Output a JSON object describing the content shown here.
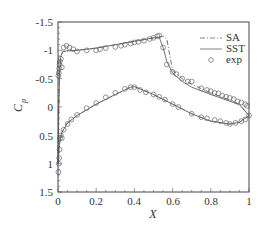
{
  "chart_data": {
    "type": "line",
    "title": "",
    "xlabel": "X",
    "ylabel": "C_p",
    "xlim": [
      0,
      1
    ],
    "ylim": [
      1.5,
      -1.5
    ],
    "y_inverted": true,
    "grid": false,
    "legend_position": "upper right",
    "x_ticks": [
      "0",
      "0.2",
      "0.4",
      "0.6",
      "0.8",
      "1"
    ],
    "y_ticks": [
      "-1.5",
      "-1",
      "-0.5",
      "0",
      "0.5",
      "1",
      "1.5"
    ],
    "series": [
      {
        "name": "SA",
        "style": "dash-dot",
        "upper": {
          "x": [
            0.0,
            0.003,
            0.008,
            0.015,
            0.025,
            0.05,
            0.1,
            0.2,
            0.3,
            0.4,
            0.5,
            0.55,
            0.57,
            0.58,
            0.6,
            0.65,
            0.7,
            0.8,
            0.9,
            0.95,
            1.0
          ],
          "y": [
            1.0,
            0.2,
            -0.6,
            -0.9,
            -0.98,
            -0.99,
            -1.0,
            -1.04,
            -1.1,
            -1.16,
            -1.22,
            -1.25,
            -1.2,
            -1.0,
            -0.65,
            -0.5,
            -0.4,
            -0.25,
            -0.12,
            -0.05,
            0.15
          ]
        },
        "lower": {
          "x": [
            0.0,
            0.005,
            0.01,
            0.02,
            0.05,
            0.1,
            0.2,
            0.3,
            0.38,
            0.4,
            0.5,
            0.6,
            0.7,
            0.8,
            0.9,
            0.95,
            0.98,
            1.0
          ],
          "y": [
            1.0,
            0.75,
            0.6,
            0.45,
            0.28,
            0.15,
            -0.05,
            -0.22,
            -0.35,
            -0.36,
            -0.22,
            -0.05,
            0.12,
            0.25,
            0.3,
            0.27,
            0.2,
            0.15
          ]
        }
      },
      {
        "name": "SST",
        "style": "solid",
        "upper": {
          "x": [
            0.0,
            0.003,
            0.008,
            0.015,
            0.025,
            0.05,
            0.1,
            0.2,
            0.3,
            0.4,
            0.5,
            0.53,
            0.55,
            0.57,
            0.6,
            0.65,
            0.7,
            0.8,
            0.9,
            0.95,
            1.0
          ],
          "y": [
            1.0,
            0.2,
            -0.6,
            -0.9,
            -0.98,
            -0.99,
            -1.0,
            -1.04,
            -1.1,
            -1.16,
            -1.22,
            -1.23,
            -1.05,
            -0.8,
            -0.6,
            -0.45,
            -0.35,
            -0.22,
            -0.1,
            -0.04,
            0.15
          ]
        },
        "lower": {
          "x": [
            0.0,
            0.005,
            0.01,
            0.02,
            0.05,
            0.1,
            0.2,
            0.3,
            0.38,
            0.4,
            0.5,
            0.6,
            0.7,
            0.8,
            0.9,
            0.95,
            0.98,
            1.0
          ],
          "y": [
            1.0,
            0.75,
            0.6,
            0.45,
            0.28,
            0.15,
            -0.05,
            -0.22,
            -0.35,
            -0.36,
            -0.22,
            -0.05,
            0.12,
            0.25,
            0.3,
            0.27,
            0.2,
            0.15
          ]
        }
      },
      {
        "name": "exp",
        "style": "open-circle",
        "upper": {
          "x": [
            0.002,
            0.004,
            0.006,
            0.008,
            0.01,
            0.015,
            0.02,
            0.03,
            0.045,
            0.06,
            0.08,
            0.1,
            0.15,
            0.2,
            0.22,
            0.25,
            0.3,
            0.33,
            0.35,
            0.38,
            0.4,
            0.42,
            0.45,
            0.48,
            0.5,
            0.52,
            0.53,
            0.55,
            0.57,
            0.6,
            0.62,
            0.65,
            0.68,
            0.7,
            0.75,
            0.78,
            0.8,
            0.82,
            0.84,
            0.86,
            0.88,
            0.9,
            0.92,
            0.94,
            0.96,
            0.98,
            0.99
          ],
          "y": [
            -0.55,
            -0.6,
            -0.68,
            -0.75,
            -0.8,
            -0.85,
            -0.7,
            -1.05,
            -1.08,
            -1.05,
            -1.02,
            -0.98,
            -1.0,
            -1.0,
            -1.02,
            -1.04,
            -1.06,
            -1.08,
            -1.1,
            -1.12,
            -1.14,
            -1.15,
            -1.17,
            -1.2,
            -1.22,
            -1.25,
            -1.26,
            -1.05,
            -0.75,
            -0.62,
            -0.58,
            -0.5,
            -0.45,
            -0.45,
            -0.33,
            -0.3,
            -0.28,
            -0.25,
            -0.24,
            -0.2,
            -0.18,
            -0.16,
            -0.14,
            -0.1,
            -0.08,
            -0.05,
            -0.02
          ]
        },
        "lower": {
          "x": [
            0.002,
            0.004,
            0.006,
            0.008,
            0.01,
            0.015,
            0.02,
            0.03,
            0.05,
            0.07,
            0.1,
            0.15,
            0.2,
            0.25,
            0.3,
            0.35,
            0.38,
            0.4,
            0.43,
            0.46,
            0.5,
            0.53,
            0.56,
            0.6,
            0.63,
            0.7,
            0.75,
            0.78,
            0.82,
            0.85,
            0.88,
            0.9,
            0.93,
            0.96,
            0.98,
            1.0
          ],
          "y": [
            1.15,
            1.0,
            0.9,
            0.75,
            0.55,
            0.5,
            0.55,
            0.4,
            0.3,
            0.22,
            0.14,
            0.02,
            -0.07,
            -0.17,
            -0.25,
            -0.32,
            -0.35,
            -0.35,
            -0.3,
            -0.26,
            -0.22,
            -0.18,
            -0.13,
            -0.05,
            0.0,
            0.12,
            0.18,
            0.2,
            0.23,
            0.25,
            0.28,
            0.3,
            0.28,
            0.25,
            0.22,
            0.15
          ]
        }
      }
    ]
  },
  "legend": {
    "items": [
      {
        "label": "SA",
        "style": "dash-dot"
      },
      {
        "label": "SST",
        "style": "solid"
      },
      {
        "label": "exp",
        "style": "circle"
      }
    ]
  },
  "axes": {
    "xlabel": "X",
    "ylabel_main": "C",
    "ylabel_sub": "p",
    "x_tick_labels": [
      "0",
      "0.2",
      "0.4",
      "0.6",
      "0.8",
      "1"
    ],
    "y_tick_labels": [
      "-1.5",
      "-1",
      "-0.5",
      "0",
      "0.5",
      "1",
      "1.5"
    ]
  },
  "colors": {
    "line": "#555555",
    "axis": "#444444",
    "text": "#333333"
  }
}
